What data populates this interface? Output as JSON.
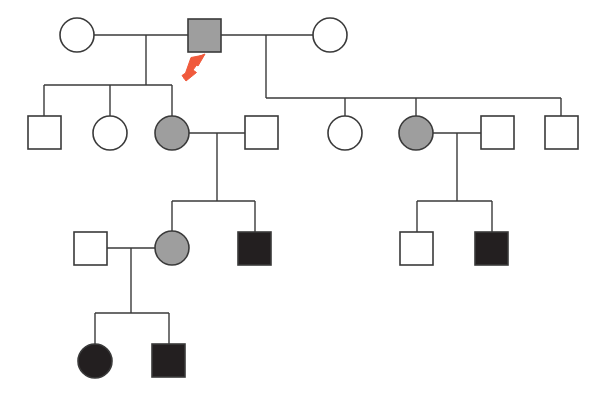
{
  "figure": {
    "kind": "pedigree-chart",
    "width": 599,
    "height": 394,
    "background_color": "#ffffff",
    "line_color": "#3a3a3a"
  },
  "legend_semantics": {
    "square": "male",
    "circle": "female",
    "unfilled": "unaffected",
    "gray_filled": "carrier / mildly affected",
    "black_filled": "affected",
    "arrow": "proband"
  },
  "colors": {
    "unaffected_fill": "#ffffff",
    "carrier_fill": "#9e9e9e",
    "affected_fill": "#231f20",
    "stroke": "#3a3a3a",
    "proband_arrow": "#f05a3c"
  },
  "generations": [
    {
      "id": "I",
      "label": "I",
      "individuals": [
        {
          "id": "I-1",
          "shape": "circle",
          "sex": "female",
          "status": "unaffected",
          "fill": "#ffffff",
          "cx": 77,
          "cy": 35,
          "r": 17
        },
        {
          "id": "I-2",
          "shape": "square",
          "sex": "male",
          "status": "carrier",
          "fill": "#9e9e9e",
          "proband": true,
          "x": 188,
          "y": 19,
          "size": 33
        },
        {
          "id": "I-3",
          "shape": "circle",
          "sex": "female",
          "status": "unaffected",
          "fill": "#ffffff",
          "cx": 330,
          "cy": 35,
          "r": 17
        }
      ]
    },
    {
      "id": "II",
      "label": "II",
      "individuals": [
        {
          "id": "II-1",
          "shape": "square",
          "sex": "male",
          "status": "unaffected",
          "fill": "#ffffff",
          "x": 28,
          "y": 116,
          "size": 33
        },
        {
          "id": "II-2",
          "shape": "circle",
          "sex": "female",
          "status": "unaffected",
          "fill": "#ffffff",
          "cx": 110,
          "cy": 133,
          "r": 17
        },
        {
          "id": "II-3",
          "shape": "circle",
          "sex": "female",
          "status": "carrier",
          "fill": "#9e9e9e",
          "cx": 172,
          "cy": 133,
          "r": 17
        },
        {
          "id": "II-4",
          "shape": "square",
          "sex": "male",
          "status": "unaffected",
          "fill": "#ffffff",
          "x": 245,
          "y": 116,
          "size": 33
        },
        {
          "id": "II-5",
          "shape": "circle",
          "sex": "female",
          "status": "unaffected",
          "fill": "#ffffff",
          "cx": 345,
          "cy": 133,
          "r": 17
        },
        {
          "id": "II-6",
          "shape": "circle",
          "sex": "female",
          "status": "carrier",
          "fill": "#9e9e9e",
          "cx": 416,
          "cy": 133,
          "r": 17
        },
        {
          "id": "II-7",
          "shape": "square",
          "sex": "male",
          "status": "unaffected",
          "fill": "#ffffff",
          "x": 481,
          "y": 116,
          "size": 33
        },
        {
          "id": "II-8",
          "shape": "square",
          "sex": "male",
          "status": "unaffected",
          "fill": "#ffffff",
          "x": 545,
          "y": 116,
          "size": 33
        }
      ]
    },
    {
      "id": "III",
      "label": "III",
      "individuals": [
        {
          "id": "III-1",
          "shape": "square",
          "sex": "male",
          "status": "unaffected",
          "fill": "#ffffff",
          "x": 74,
          "y": 232,
          "size": 33
        },
        {
          "id": "III-2",
          "shape": "circle",
          "sex": "female",
          "status": "carrier",
          "fill": "#9e9e9e",
          "cx": 172,
          "cy": 248,
          "r": 17
        },
        {
          "id": "III-3",
          "shape": "square",
          "sex": "male",
          "status": "affected",
          "fill": "#231f20",
          "x": 238,
          "y": 232,
          "size": 33
        },
        {
          "id": "III-4",
          "shape": "square",
          "sex": "male",
          "status": "unaffected",
          "fill": "#ffffff",
          "x": 400,
          "y": 232,
          "size": 33
        },
        {
          "id": "III-5",
          "shape": "square",
          "sex": "male",
          "status": "affected",
          "fill": "#231f20",
          "x": 475,
          "y": 232,
          "size": 33
        }
      ]
    },
    {
      "id": "IV",
      "label": "IV",
      "individuals": [
        {
          "id": "IV-1",
          "shape": "circle",
          "sex": "female",
          "status": "affected",
          "fill": "#231f20",
          "cx": 95,
          "cy": 361,
          "r": 17
        },
        {
          "id": "IV-2",
          "shape": "square",
          "sex": "male",
          "status": "affected",
          "fill": "#231f20",
          "x": 152,
          "y": 344,
          "size": 33
        }
      ]
    }
  ],
  "matings": [
    {
      "id": "mating-1",
      "partners": [
        "I-1",
        "I-2"
      ],
      "children": [
        "II-1",
        "II-2",
        "II-3"
      ]
    },
    {
      "id": "mating-2",
      "partners": [
        "I-2",
        "I-3"
      ],
      "children": [
        "II-5",
        "II-6",
        "II-8"
      ]
    },
    {
      "id": "mating-3",
      "partners": [
        "II-3",
        "II-4"
      ],
      "children": [
        "III-2",
        "III-3"
      ]
    },
    {
      "id": "mating-4",
      "partners": [
        "II-6",
        "II-7"
      ],
      "children": [
        "III-4",
        "III-5"
      ]
    },
    {
      "id": "mating-5",
      "partners": [
        "III-1",
        "III-2"
      ],
      "children": [
        "IV-1",
        "IV-2"
      ]
    }
  ],
  "proband": {
    "individual_id": "I-2",
    "marker": "arrow",
    "color": "#f05a3c",
    "points_to": "top-right"
  }
}
